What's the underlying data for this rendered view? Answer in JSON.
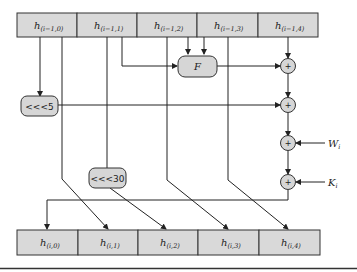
{
  "diagram": {
    "type": "SHA-1 round function",
    "input_registers": [
      {
        "label": "h",
        "subscript": "(i−1,0)"
      },
      {
        "label": "h",
        "subscript": "(i−1,1)"
      },
      {
        "label": "h",
        "subscript": "(i−1,2)"
      },
      {
        "label": "h",
        "subscript": "(i−1,3)"
      },
      {
        "label": "h",
        "subscript": "(i−1,4)"
      }
    ],
    "output_registers": [
      {
        "label": "h",
        "subscript": "(i,0)"
      },
      {
        "label": "h",
        "subscript": "(i,1)"
      },
      {
        "label": "h",
        "subscript": "(i,2)"
      },
      {
        "label": "h",
        "subscript": "(i,3)"
      },
      {
        "label": "h",
        "subscript": "(i,4)"
      }
    ],
    "function_box": "F",
    "rotate_5": "<<<5",
    "rotate_30": "<<<30",
    "adder_symbol": "+",
    "inputs": {
      "w": {
        "label": "W",
        "subscript": "i"
      },
      "k": {
        "label": "K",
        "subscript": "i"
      }
    },
    "colors": {
      "fill": "#d9d9d9",
      "stroke": "#333333"
    }
  }
}
